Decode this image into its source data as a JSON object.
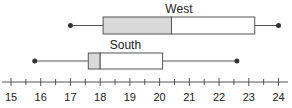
{
  "chart_data": {
    "type": "boxplot",
    "title": "",
    "xlabel": "",
    "ylabel": "",
    "xlim": [
      15,
      24
    ],
    "ticks": [
      15,
      16,
      17,
      18,
      19,
      20,
      21,
      22,
      23,
      24
    ],
    "minor_tick_step": 0.5,
    "grid": false,
    "series": [
      {
        "name": "West",
        "min": 17,
        "q1": 18.1,
        "median": 20.4,
        "q3": 23.2,
        "max": 24,
        "shade": "lower"
      },
      {
        "name": "South",
        "min": 15.8,
        "q1": 17.6,
        "median": 18,
        "q3": 20.1,
        "max": 22.6,
        "shade": "lower"
      }
    ],
    "colors": {
      "line": "#555555",
      "shade": "#d9d9d9",
      "box_fill": "#ffffff",
      "dot": "#333333"
    }
  }
}
